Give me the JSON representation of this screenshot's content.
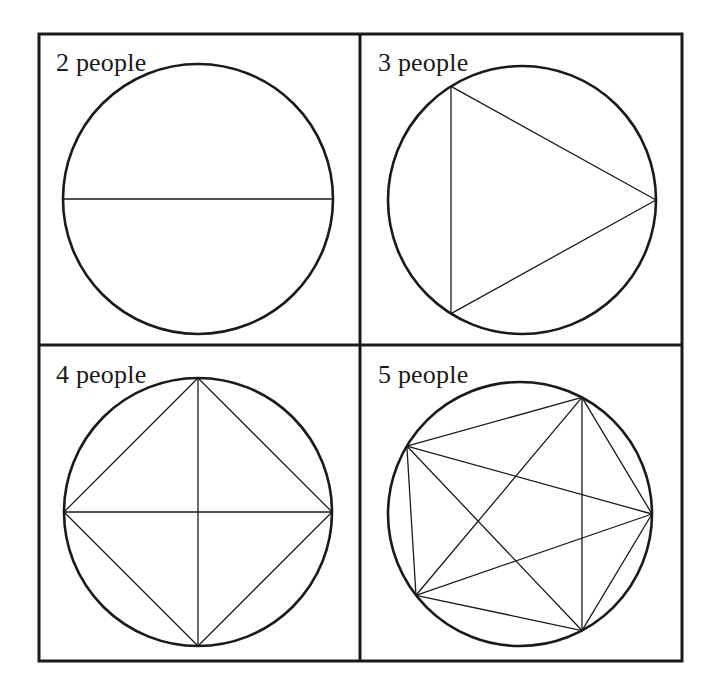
{
  "figure": {
    "background_color": "#ffffff",
    "ink_color": "#1a1a1a",
    "frame": {
      "x": 39,
      "y": 34,
      "width": 643,
      "height": 627,
      "stroke_width": 3
    },
    "dividers": {
      "vertical_x": 360,
      "horizontal_y": 345,
      "stroke_width": 3
    }
  },
  "panels": [
    {
      "id": "panel-2-people",
      "label": "2 people",
      "people": 2,
      "handshakes": 1,
      "circle": {
        "cx": 198,
        "cy": 199,
        "r": 135,
        "stroke_width": 2.6
      },
      "vertex_angles_deg": [
        0,
        180
      ],
      "chord_stroke_width": 1.3
    },
    {
      "id": "panel-3-people",
      "label": "3 people",
      "people": 3,
      "handshakes": 3,
      "circle": {
        "cx": 522,
        "cy": 200,
        "r": 134,
        "stroke_width": 2.6
      },
      "vertex_angles_deg": [
        0,
        122,
        238
      ],
      "chord_stroke_width": 1.3
    },
    {
      "id": "panel-4-people",
      "label": "4 people",
      "people": 4,
      "handshakes": 6,
      "circle": {
        "cx": 198,
        "cy": 512,
        "r": 134,
        "stroke_width": 2.6
      },
      "vertex_angles_deg": [
        0,
        90,
        180,
        270
      ],
      "chord_stroke_width": 1.3
    },
    {
      "id": "panel-5-people",
      "label": "5 people",
      "people": 5,
      "handshakes": 10,
      "circle": {
        "cx": 520,
        "cy": 514,
        "r": 132,
        "stroke_width": 2.6
      },
      "vertex_angles_deg": [
        0,
        62,
        149,
        218,
        298
      ],
      "chord_stroke_width": 1.3
    }
  ]
}
